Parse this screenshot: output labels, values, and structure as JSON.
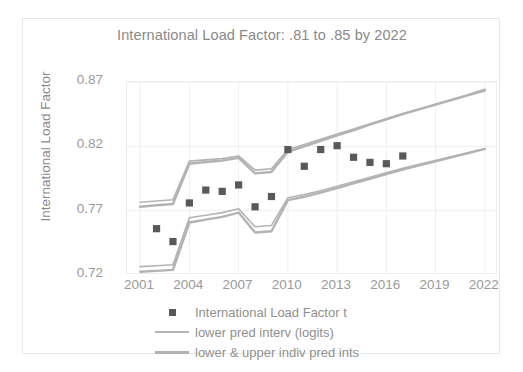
{
  "chart_data": {
    "type": "scatter",
    "title": "International Load Factor:  .81 to .85 by 2022",
    "xlabel": "",
    "ylabel": "International Load Factor",
    "xlim": [
      2000.2,
      2022.8
    ],
    "ylim": [
      0.72,
      0.87
    ],
    "yticks": [
      "0.72",
      "0.77",
      "0.82",
      "0.87"
    ],
    "ytick_values": [
      0.72,
      0.77,
      0.82,
      0.87
    ],
    "xticks": [
      "2001",
      "2004",
      "2007",
      "2010",
      "2013",
      "2016",
      "2019",
      "2022"
    ],
    "xtick_values": [
      2001,
      2004,
      2007,
      2010,
      2013,
      2016,
      2019,
      2022
    ],
    "grid": true,
    "legend_position": "bottom",
    "marker_color": "#595959",
    "band_color": "#b3b3b3",
    "series": [
      {
        "name": "International Load Factor t",
        "type": "scatter",
        "x": [
          2002,
          2003,
          2004,
          2005,
          2006,
          2007,
          2008,
          2009,
          2010,
          2011,
          2012,
          2013,
          2014,
          2015,
          2016,
          2017
        ],
        "values": [
          0.756,
          0.746,
          0.776,
          0.786,
          0.785,
          0.79,
          0.773,
          0.781,
          0.8175,
          0.8045,
          0.8175,
          0.8205,
          0.8115,
          0.8075,
          0.8065,
          0.8125
        ]
      },
      {
        "name": "lower pred interv (logits)",
        "type": "line",
        "x": [
          2001,
          2002,
          2003,
          2004,
          2005,
          2006,
          2007,
          2008,
          2009,
          2010,
          2011,
          2012,
          2013,
          2014,
          2015,
          2016,
          2017,
          2018,
          2019,
          2020,
          2021,
          2022
        ],
        "upper": [
          0.7765,
          0.7775,
          0.7785,
          0.8085,
          0.8095,
          0.8105,
          0.8125,
          0.8015,
          0.8025,
          0.8175,
          0.8215,
          0.8255,
          0.8295,
          0.8335,
          0.8375,
          0.8415,
          0.8455,
          0.849,
          0.8525,
          0.856,
          0.8595,
          0.863
        ],
        "lower": [
          0.7265,
          0.7272,
          0.728,
          0.7645,
          0.7665,
          0.7685,
          0.7715,
          0.7575,
          0.7585,
          0.78,
          0.7825,
          0.7855,
          0.789,
          0.7925,
          0.796,
          0.7995,
          0.803,
          0.806,
          0.809,
          0.812,
          0.815,
          0.818
        ]
      },
      {
        "name": "lower & upper indiv pred ints",
        "type": "line",
        "x": [
          2001,
          2002,
          2003,
          2004,
          2005,
          2006,
          2007,
          2008,
          2009,
          2010,
          2011,
          2012,
          2013,
          2014,
          2015,
          2016,
          2017,
          2018,
          2019,
          2020,
          2021,
          2022
        ],
        "upper": [
          0.773,
          0.7742,
          0.7752,
          0.8065,
          0.8078,
          0.809,
          0.811,
          0.799,
          0.8,
          0.8158,
          0.82,
          0.8242,
          0.8285,
          0.8325,
          0.8368,
          0.841,
          0.845,
          0.8488,
          0.8525,
          0.8562,
          0.86,
          0.864
        ],
        "lower": [
          0.7225,
          0.7232,
          0.724,
          0.7608,
          0.763,
          0.7652,
          0.7685,
          0.753,
          0.754,
          0.7782,
          0.7808,
          0.784,
          0.7875,
          0.7912,
          0.7948,
          0.7985,
          0.802,
          0.8052,
          0.8084,
          0.8116,
          0.8148,
          0.818
        ]
      }
    ]
  },
  "legend": {
    "items": [
      {
        "label": "International Load Factor t",
        "marker": "square"
      },
      {
        "label": "lower pred interv (logits)",
        "marker": "line-thin"
      },
      {
        "label": "lower & upper indiv pred ints",
        "marker": "line-thick"
      }
    ]
  }
}
